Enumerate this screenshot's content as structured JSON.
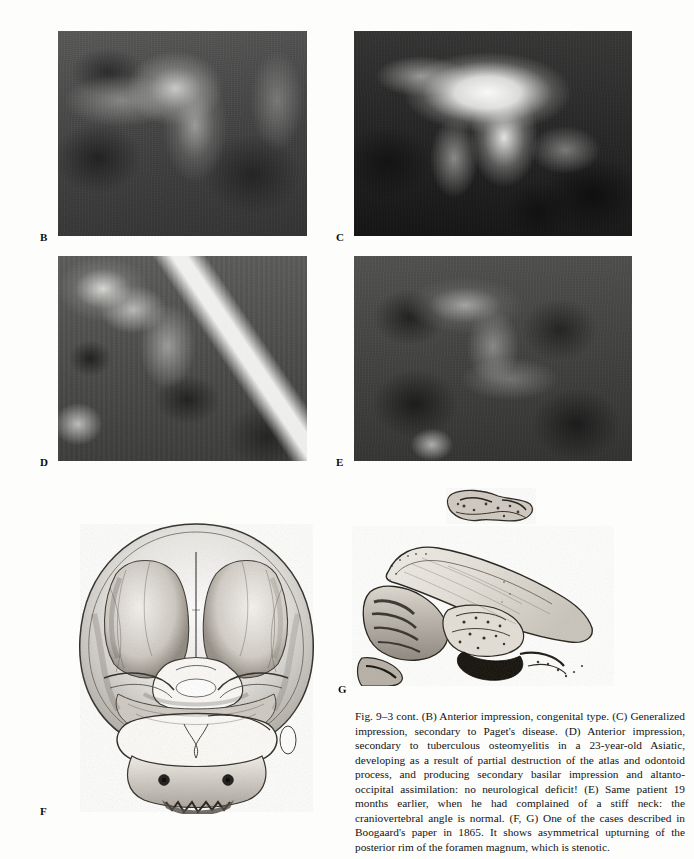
{
  "page": {
    "width": 694,
    "height": 859,
    "background": "#fdfdfc",
    "figure_id": "Fig. 9-3 cont."
  },
  "plates": [
    {
      "letter": "B",
      "kind": "radiograph",
      "modality": "lateral radiograph",
      "subject": "Anterior impression, congenital type",
      "appearance": "dark, low-contrast, grainy lateral cervicocranial film"
    },
    {
      "letter": "C",
      "kind": "radiograph",
      "modality": "lateral radiograph",
      "subject": "Generalized impression, secondary to Paget's disease",
      "appearance": "bright blown-out sclerotic skull base with dark surround"
    },
    {
      "letter": "D",
      "kind": "radiograph",
      "modality": "lateral radiograph",
      "subject": "Anterior impression, secondary to tuberculous osteomyelitis",
      "appearance": "mid-grey film with bright oblique streak at lower right"
    },
    {
      "letter": "E",
      "kind": "radiograph",
      "modality": "lateral radiograph",
      "subject": "Same patient 19 months earlier, normal craniovertebral angle",
      "appearance": "darker, softer lateral film"
    },
    {
      "letter": "F",
      "kind": "engraving",
      "modality": "anatomical specimen engraving",
      "subject": "Skull base viewed from above with foramen magnum",
      "appearance": "stippled line engraving on white paper"
    },
    {
      "letter": "G",
      "kind": "engraving",
      "modality": "anatomical specimen engraving",
      "subject": "Sagittal section of skull base with separate bone fragment above",
      "appearance": "stippled line engraving on white paper"
    }
  ],
  "caption": {
    "text": "Fig. 9–3 cont. (B) Anterior impression, congenital type. (C) Generalized impression, secondary to Paget's disease. (D) Anterior impression, secondary to tuberculous osteomyelitis in a 23-year-old Asiatic, developing as a result of partial destruction of the atlas and odontoid process, and producing secondary basilar impression and altanto-occipital assimilation: no neurological deficit! (E) Same patient 19 months earlier, when he had complained of a stiff neck: the craniovertebral angle is normal. (F, G) One of the cases described in Boogaard's paper in 1865. It shows asymmetrical upturning of the posterior rim of the foramen magnum, which is stenotic."
  }
}
